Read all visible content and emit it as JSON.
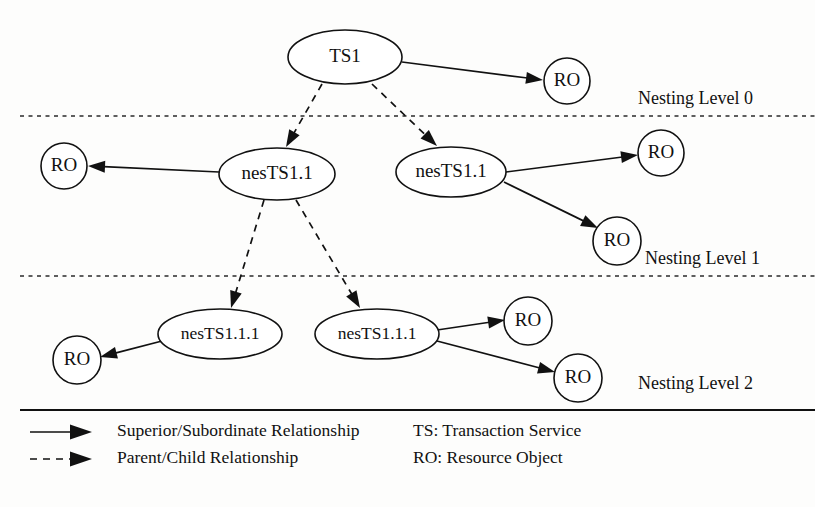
{
  "figure": {
    "background_color": "#fdfdfc",
    "line_color": "#111111"
  },
  "nodes": [
    {
      "id": "ts1",
      "label": "TS1",
      "shape": "ellipse",
      "cx": 345,
      "cy": 57,
      "rx": 57,
      "ry": 27,
      "level": 0
    },
    {
      "id": "ro_top",
      "label": "RO",
      "shape": "circle",
      "cx": 567,
      "cy": 81,
      "rx": 23,
      "ry": 23,
      "level": 0
    },
    {
      "id": "nests11_a",
      "label": "nesTS1.1",
      "shape": "ellipse",
      "cx": 277,
      "cy": 174,
      "rx": 58,
      "ry": 26,
      "level": 1
    },
    {
      "id": "nests11_b",
      "label": "nesTS1.1",
      "shape": "ellipse",
      "cx": 451,
      "cy": 172,
      "rx": 55,
      "ry": 25,
      "level": 1
    },
    {
      "id": "ro_l1_left",
      "label": "RO",
      "shape": "circle",
      "cx": 64,
      "cy": 166,
      "rx": 23,
      "ry": 23,
      "level": 1
    },
    {
      "id": "ro_l1_r1",
      "label": "RO",
      "shape": "circle",
      "cx": 661,
      "cy": 153,
      "rx": 23,
      "ry": 23,
      "level": 1
    },
    {
      "id": "ro_l1_r2",
      "label": "RO",
      "shape": "circle",
      "cx": 617,
      "cy": 241,
      "rx": 24,
      "ry": 24,
      "level": 1
    },
    {
      "id": "nests111_a",
      "label": "nesTS1.1.1",
      "shape": "ellipse",
      "cx": 220,
      "cy": 334,
      "rx": 62,
      "ry": 25,
      "level": 2
    },
    {
      "id": "nests111_b",
      "label": "nesTS1.1.1",
      "shape": "ellipse",
      "cx": 377,
      "cy": 334,
      "rx": 62,
      "ry": 25,
      "level": 2
    },
    {
      "id": "ro_l2_left",
      "label": "RO",
      "shape": "circle",
      "cx": 77,
      "cy": 360,
      "rx": 24,
      "ry": 24,
      "level": 2
    },
    {
      "id": "ro_l2_r1",
      "label": "RO",
      "shape": "circle",
      "cx": 528,
      "cy": 321,
      "rx": 24,
      "ry": 24,
      "level": 2
    },
    {
      "id": "ro_l2_r2",
      "label": "RO",
      "shape": "circle",
      "cx": 578,
      "cy": 378,
      "rx": 24,
      "ry": 24,
      "level": 2
    }
  ],
  "edges": [
    {
      "id": "e1",
      "from": "ts1",
      "to": "ro_top",
      "style": "solid",
      "relationship": "Superior/Subordinate Relationship",
      "x1": 402,
      "y1": 62,
      "x2": 543,
      "y2": 80
    },
    {
      "id": "e2",
      "from": "ts1",
      "to": "nests11_a",
      "style": "dashed",
      "relationship": "Parent/Child Relationship",
      "x1": 322,
      "y1": 84,
      "x2": 286,
      "y2": 147
    },
    {
      "id": "e3",
      "from": "ts1",
      "to": "nests11_b",
      "style": "dashed",
      "relationship": "Parent/Child Relationship",
      "x1": 372,
      "y1": 84,
      "x2": 437,
      "y2": 146
    },
    {
      "id": "e4",
      "from": "nests11_a",
      "to": "ro_l1_left",
      "style": "solid",
      "relationship": "Superior/Subordinate Relationship",
      "x1": 219,
      "y1": 172,
      "x2": 88,
      "y2": 166
    },
    {
      "id": "e5",
      "from": "nests11_a",
      "to": "nests111_a",
      "style": "dashed",
      "relationship": "Parent/Child Relationship",
      "x1": 264,
      "y1": 200,
      "x2": 231,
      "y2": 308
    },
    {
      "id": "e6",
      "from": "nests11_a",
      "to": "nests111_b",
      "style": "dashed",
      "relationship": "Parent/Child Relationship",
      "x1": 296,
      "y1": 200,
      "x2": 360,
      "y2": 308
    },
    {
      "id": "e7",
      "from": "nests11_b",
      "to": "ro_l1_r1",
      "style": "solid",
      "relationship": "Superior/Subordinate Relationship",
      "x1": 506,
      "y1": 172,
      "x2": 638,
      "y2": 155
    },
    {
      "id": "e8",
      "from": "nests11_b",
      "to": "ro_l1_r2",
      "style": "solid",
      "relationship": "Superior/Subordinate Relationship",
      "x1": 504,
      "y1": 182,
      "x2": 598,
      "y2": 228
    },
    {
      "id": "e9",
      "from": "nests111_a",
      "to": "ro_l2_left",
      "style": "solid",
      "relationship": "Superior/Subordinate Relationship",
      "x1": 162,
      "y1": 341,
      "x2": 100,
      "y2": 357
    },
    {
      "id": "e10",
      "from": "nests111_b",
      "to": "ro_l2_r1",
      "style": "solid",
      "relationship": "Superior/Subordinate Relationship",
      "x1": 437,
      "y1": 330,
      "x2": 505,
      "y2": 320
    },
    {
      "id": "e11",
      "from": "nests111_b",
      "to": "ro_l2_r2",
      "style": "solid",
      "relationship": "Superior/Subordinate Relationship",
      "x1": 437,
      "y1": 341,
      "x2": 555,
      "y2": 372
    }
  ],
  "separators": [
    {
      "id": "sep0",
      "style": "dashed",
      "y": 116,
      "x1": 20,
      "x2": 815
    },
    {
      "id": "sep1",
      "style": "dashed",
      "y": 276,
      "x1": 20,
      "x2": 815
    },
    {
      "id": "sep2",
      "style": "solid",
      "y": 410,
      "x1": 20,
      "x2": 815
    }
  ],
  "level_labels": [
    {
      "id": "lvl0",
      "text": "Nesting Level 0",
      "x": 638,
      "y": 100
    },
    {
      "id": "lvl1",
      "text": "Nesting Level 1",
      "x": 645,
      "y": 260
    },
    {
      "id": "lvl2",
      "text": "Nesting Level 2",
      "x": 638,
      "y": 385
    }
  ],
  "legend": {
    "items": [
      {
        "id": "legend-solid",
        "style": "solid",
        "label": "Superior/Subordinate Relationship",
        "line_x1": 30,
        "line_x2": 92,
        "y": 432,
        "text_x": 117
      },
      {
        "id": "legend-dashed",
        "style": "dashed",
        "label": "Parent/Child Relationship",
        "line_x1": 30,
        "line_x2": 92,
        "y": 459,
        "text_x": 117
      }
    ],
    "abbreviations": [
      {
        "id": "abbr-ts",
        "label": "TS: Transaction Service",
        "x": 413,
        "y": 432
      },
      {
        "id": "abbr-ro",
        "label": "RO: Resource Object",
        "x": 413,
        "y": 459
      }
    ]
  }
}
